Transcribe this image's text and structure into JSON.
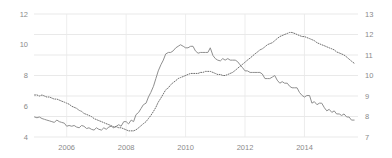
{
  "chart_data": {
    "type": "line",
    "title": "",
    "subtitle": "",
    "xlabel": "",
    "ylabel": "",
    "grid": true,
    "legend_position": "none",
    "x_ticks": [
      "2006",
      "2008",
      "2010",
      "2012",
      "2014"
    ],
    "x_tick_values": [
      2006,
      2008,
      2010,
      2012,
      2014
    ],
    "xlim": [
      2004.9,
      2015.8
    ],
    "left_axis": {
      "ticks": [
        "4",
        "6",
        "8",
        "10",
        "12"
      ],
      "tick_values": [
        4,
        6,
        8,
        10,
        12
      ],
      "ylim": [
        4,
        12
      ],
      "series": "solid"
    },
    "right_axis": {
      "ticks": [
        "7",
        "8",
        "9",
        "10",
        "11",
        "12",
        "13"
      ],
      "tick_values": [
        7,
        8,
        9,
        10,
        11,
        12,
        13
      ],
      "ylim": [
        7,
        13
      ],
      "series": "dotted"
    },
    "series": [
      {
        "name": "solid-line-left-axis",
        "style": "solid",
        "color": "#8f8f8f",
        "axis": "left",
        "x": [
          2004.92,
          2005.0,
          2005.08,
          2005.17,
          2005.25,
          2005.33,
          2005.42,
          2005.5,
          2005.58,
          2005.67,
          2005.75,
          2005.83,
          2005.92,
          2006.0,
          2006.08,
          2006.17,
          2006.25,
          2006.33,
          2006.42,
          2006.5,
          2006.58,
          2006.67,
          2006.75,
          2006.83,
          2006.92,
          2007.0,
          2007.08,
          2007.17,
          2007.25,
          2007.33,
          2007.42,
          2007.5,
          2007.58,
          2007.67,
          2007.75,
          2007.83,
          2007.92,
          2008.0,
          2008.08,
          2008.17,
          2008.25,
          2008.33,
          2008.42,
          2008.5,
          2008.58,
          2008.67,
          2008.75,
          2008.83,
          2008.92,
          2009.0,
          2009.08,
          2009.17,
          2009.25,
          2009.33,
          2009.42,
          2009.5,
          2009.58,
          2009.67,
          2009.75,
          2009.83,
          2009.92,
          2010.0,
          2010.08,
          2010.17,
          2010.25,
          2010.33,
          2010.42,
          2010.5,
          2010.58,
          2010.67,
          2010.75,
          2010.83,
          2010.92,
          2011.0,
          2011.08,
          2011.17,
          2011.25,
          2011.33,
          2011.42,
          2011.5,
          2011.58,
          2011.67,
          2011.75,
          2011.83,
          2011.92,
          2012.0,
          2012.08,
          2012.17,
          2012.25,
          2012.33,
          2012.42,
          2012.5,
          2012.58,
          2012.67,
          2012.75,
          2012.83,
          2012.92,
          2013.0,
          2013.08,
          2013.17,
          2013.25,
          2013.33,
          2013.42,
          2013.5,
          2013.58,
          2013.67,
          2013.75,
          2013.83,
          2013.92,
          2014.0,
          2014.08,
          2014.17,
          2014.25,
          2014.33,
          2014.42,
          2014.5,
          2014.58,
          2014.67,
          2014.75,
          2014.83,
          2014.92,
          2015.0,
          2015.08,
          2015.17,
          2015.25,
          2015.33,
          2015.42,
          2015.5,
          2015.58,
          2015.67
        ],
        "values": [
          5.3,
          5.25,
          5.3,
          5.2,
          5.15,
          5.1,
          5.05,
          5.0,
          4.95,
          5.1,
          5.0,
          4.95,
          4.9,
          4.7,
          4.75,
          4.7,
          4.75,
          4.65,
          4.6,
          4.75,
          4.7,
          4.55,
          4.6,
          4.5,
          4.45,
          4.6,
          4.5,
          4.45,
          4.6,
          4.5,
          4.65,
          4.7,
          4.6,
          4.7,
          4.8,
          4.7,
          5.0,
          5.0,
          4.85,
          5.1,
          5.0,
          5.45,
          5.6,
          5.85,
          6.1,
          6.2,
          6.6,
          6.9,
          7.3,
          7.8,
          8.3,
          8.7,
          9.0,
          9.4,
          9.5,
          9.5,
          9.6,
          9.8,
          9.9,
          10.0,
          9.9,
          9.8,
          9.8,
          9.9,
          9.9,
          9.6,
          9.45,
          9.5,
          9.5,
          9.5,
          9.5,
          9.8,
          9.3,
          9.1,
          9.0,
          8.95,
          9.1,
          9.0,
          9.1,
          9.0,
          9.0,
          9.0,
          8.9,
          8.7,
          8.5,
          8.3,
          8.3,
          8.2,
          8.2,
          8.2,
          8.2,
          8.2,
          8.1,
          7.8,
          7.8,
          7.8,
          7.9,
          8.0,
          7.7,
          7.5,
          7.6,
          7.5,
          7.5,
          7.3,
          7.2,
          7.2,
          7.2,
          6.9,
          6.7,
          6.6,
          6.7,
          6.7,
          6.2,
          6.3,
          6.1,
          6.2,
          6.2,
          5.9,
          5.7,
          5.8,
          5.6,
          5.7,
          5.5,
          5.5,
          5.4,
          5.5,
          5.3,
          5.3,
          5.1,
          5.1
        ]
      },
      {
        "name": "dotted-line-right-axis",
        "style": "dotted",
        "color": "#6e6e6e",
        "axis": "right",
        "x": [
          2004.92,
          2005.0,
          2005.08,
          2005.17,
          2005.25,
          2005.33,
          2005.42,
          2005.5,
          2005.58,
          2005.67,
          2005.75,
          2005.83,
          2005.92,
          2006.0,
          2006.08,
          2006.17,
          2006.25,
          2006.33,
          2006.42,
          2006.5,
          2006.58,
          2006.67,
          2006.75,
          2006.83,
          2006.92,
          2007.0,
          2007.08,
          2007.17,
          2007.25,
          2007.33,
          2007.42,
          2007.5,
          2007.58,
          2007.67,
          2007.75,
          2007.83,
          2007.92,
          2008.0,
          2008.08,
          2008.17,
          2008.25,
          2008.33,
          2008.42,
          2008.5,
          2008.58,
          2008.67,
          2008.75,
          2008.83,
          2008.92,
          2009.0,
          2009.08,
          2009.17,
          2009.25,
          2009.33,
          2009.42,
          2009.5,
          2009.58,
          2009.67,
          2009.75,
          2009.83,
          2009.92,
          2010.0,
          2010.08,
          2010.17,
          2010.25,
          2010.33,
          2010.42,
          2010.5,
          2010.58,
          2010.67,
          2010.75,
          2010.83,
          2010.92,
          2011.0,
          2011.08,
          2011.17,
          2011.25,
          2011.33,
          2011.42,
          2011.5,
          2011.58,
          2011.67,
          2011.75,
          2011.83,
          2011.92,
          2012.0,
          2012.08,
          2012.17,
          2012.25,
          2012.33,
          2012.42,
          2012.5,
          2012.58,
          2012.67,
          2012.75,
          2012.83,
          2012.92,
          2013.0,
          2013.08,
          2013.17,
          2013.25,
          2013.33,
          2013.42,
          2013.5,
          2013.58,
          2013.67,
          2013.75,
          2013.83,
          2013.92,
          2014.0,
          2014.08,
          2014.17,
          2014.25,
          2014.33,
          2014.42,
          2014.5,
          2014.58,
          2014.67,
          2014.75,
          2014.83,
          2014.92,
          2015.0,
          2015.08,
          2015.17,
          2015.25,
          2015.33,
          2015.42,
          2015.5,
          2015.58,
          2015.67
        ],
        "values": [
          9.05,
          9.05,
          9.0,
          9.05,
          9.0,
          8.95,
          8.95,
          8.9,
          8.85,
          8.85,
          8.8,
          8.75,
          8.7,
          8.65,
          8.6,
          8.5,
          8.45,
          8.4,
          8.3,
          8.25,
          8.15,
          8.1,
          8.05,
          8.0,
          7.9,
          7.85,
          7.8,
          7.75,
          7.7,
          7.65,
          7.6,
          7.55,
          7.5,
          7.5,
          7.45,
          7.45,
          7.4,
          7.35,
          7.3,
          7.3,
          7.3,
          7.35,
          7.45,
          7.55,
          7.65,
          7.75,
          7.9,
          8.05,
          8.25,
          8.45,
          8.7,
          8.9,
          9.1,
          9.3,
          9.4,
          9.55,
          9.65,
          9.75,
          9.85,
          9.9,
          9.95,
          10.0,
          10.05,
          10.1,
          10.1,
          10.1,
          10.1,
          10.15,
          10.15,
          10.2,
          10.2,
          10.2,
          10.15,
          10.1,
          10.05,
          10.05,
          10.0,
          10.0,
          10.05,
          10.1,
          10.15,
          10.25,
          10.35,
          10.45,
          10.55,
          10.65,
          10.75,
          10.85,
          10.95,
          11.05,
          11.15,
          11.25,
          11.3,
          11.4,
          11.5,
          11.55,
          11.6,
          11.7,
          11.8,
          11.9,
          11.95,
          12.0,
          12.05,
          12.1,
          12.1,
          12.05,
          12.0,
          11.95,
          11.9,
          11.9,
          11.85,
          11.8,
          11.75,
          11.7,
          11.6,
          11.55,
          11.5,
          11.45,
          11.4,
          11.35,
          11.3,
          11.25,
          11.15,
          11.1,
          11.05,
          11.0,
          10.9,
          10.8,
          10.7,
          10.6
        ]
      }
    ]
  },
  "plot": {
    "left_px": 34,
    "right_px": 358,
    "top_px": 14,
    "bottom_px": 137
  }
}
